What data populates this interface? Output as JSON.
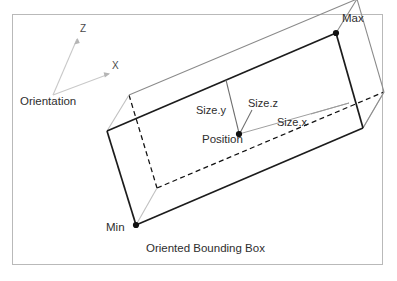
{
  "figure": {
    "caption": "Oriented Bounding Box",
    "cropped_top_text": "",
    "frame": {
      "x": 12,
      "y": 14,
      "width": 371,
      "height": 251,
      "border_color": "#b9b9b9",
      "background": "#ffffff"
    },
    "colors": {
      "background": "#ffffff",
      "frame_border": "#b9b9b9",
      "solid_edge": "#1c1c1c",
      "thin_edge": "#8a8a8a",
      "hidden_edge": "#111111",
      "axis_line": "#c9c9c9",
      "leader_line": "#6e6e6e",
      "size_x_line": "#9a9a9a",
      "marker_fill": "#111111",
      "text": "#2e2e2e"
    },
    "orientation_gizmo": {
      "label": "Orientation",
      "label_pos": {
        "x": 20,
        "y": 101
      },
      "origin": {
        "x": 53,
        "y": 95
      },
      "axes": [
        {
          "name": "Z",
          "label": "Z",
          "tip": {
            "x": 78,
            "y": 38
          },
          "label_pos": {
            "x": 80,
            "y": 28
          }
        },
        {
          "name": "X",
          "label": "X",
          "tip": {
            "x": 110,
            "y": 74
          },
          "label_pos": {
            "x": 112,
            "y": 65
          }
        }
      ]
    },
    "box": {
      "label": "oriented-bounding-box",
      "vertices": {
        "front_top_left": {
          "x": 107,
          "y": 131
        },
        "front_top_right": {
          "x": 336,
          "y": 33
        },
        "front_bottom_left": {
          "x": 136,
          "y": 225
        },
        "front_bottom_right": {
          "x": 363,
          "y": 128
        },
        "back_top_left": {
          "x": 129,
          "y": 95
        },
        "back_top_right": {
          "x": 357,
          "y": 0
        },
        "back_bottom_left": {
          "x": 157,
          "y": 188
        },
        "back_bottom_right": {
          "x": 384,
          "y": 92
        }
      }
    },
    "markers": [
      {
        "name": "max-point",
        "label": "Max",
        "point": {
          "x": 336,
          "y": 33
        },
        "label_pos": {
          "x": 342,
          "y": 18
        }
      },
      {
        "name": "min-point",
        "label": "Min",
        "point": {
          "x": 136,
          "y": 225
        },
        "label_pos": {
          "x": 106,
          "y": 227
        }
      },
      {
        "name": "position-point",
        "label": "Position",
        "point": {
          "x": 239,
          "y": 134
        },
        "label_pos": {
          "x": 202,
          "y": 139
        }
      }
    ],
    "dimension_labels": [
      {
        "name": "size-y",
        "label": "Size.y",
        "label_pos": {
          "x": 196,
          "y": 110
        }
      },
      {
        "name": "size-z",
        "label": "Size.z",
        "label_pos": {
          "x": 248,
          "y": 103
        }
      },
      {
        "name": "size-x",
        "label": "Size.x",
        "label_pos": {
          "x": 277,
          "y": 122
        }
      }
    ],
    "caption_pos": {
      "x": 146,
      "y": 248
    }
  }
}
